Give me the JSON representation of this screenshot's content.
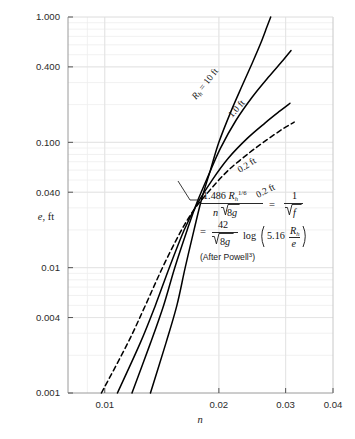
{
  "chart_data": {
    "type": "line",
    "title": "",
    "xlabel": "n",
    "ylabel": "e, ft",
    "xscale": "log",
    "yscale": "log",
    "xlim": [
      0.008,
      0.04
    ],
    "ylim": [
      0.001,
      1.0
    ],
    "grid": true,
    "legend_position": "inline-curve-labels",
    "x_ticks": [
      "0.01",
      "0.02",
      "0.03",
      "0.04"
    ],
    "x_tick_values": [
      0.01,
      0.02,
      0.03,
      0.04
    ],
    "y_ticks": [
      "1.000",
      "0.400",
      "0.100",
      "0.040",
      "0.01",
      "0.004",
      "0.001"
    ],
    "y_tick_values": [
      1.0,
      0.4,
      0.1,
      0.04,
      0.01,
      0.004,
      0.001
    ],
    "series": [
      {
        "name": "R_h = 10 ft",
        "label": "R",
        "label_sub": "h",
        "label_rest": " = 10 ft",
        "style": "solid",
        "points": [
          [
            0.0132,
            0.001
          ],
          [
            0.0145,
            0.0025
          ],
          [
            0.0155,
            0.005
          ],
          [
            0.0163,
            0.01
          ],
          [
            0.0172,
            0.02
          ],
          [
            0.018,
            0.035
          ],
          [
            0.019,
            0.06
          ],
          [
            0.02,
            0.1
          ],
          [
            0.0215,
            0.175
          ],
          [
            0.023,
            0.28
          ],
          [
            0.0245,
            0.43
          ],
          [
            0.0258,
            0.62
          ],
          [
            0.0268,
            0.84
          ],
          [
            0.0274,
            1.0
          ]
        ]
      },
      {
        "name": "1.0 ft",
        "label": "1.0 ft",
        "style": "solid",
        "points": [
          [
            0.0118,
            0.001
          ],
          [
            0.0132,
            0.0025
          ],
          [
            0.0143,
            0.005
          ],
          [
            0.0153,
            0.01
          ],
          [
            0.0165,
            0.02
          ],
          [
            0.0175,
            0.033
          ],
          [
            0.0188,
            0.055
          ],
          [
            0.0202,
            0.09
          ],
          [
            0.0222,
            0.15
          ],
          [
            0.0245,
            0.23
          ],
          [
            0.027,
            0.33
          ],
          [
            0.0295,
            0.45
          ],
          [
            0.031,
            0.54
          ]
        ]
      },
      {
        "name": "0.2 ft",
        "label": "0.2 ft",
        "style": "solid",
        "points": [
          [
            0.0108,
            0.001
          ],
          [
            0.0124,
            0.0025
          ],
          [
            0.0136,
            0.005
          ],
          [
            0.0148,
            0.01
          ],
          [
            0.0162,
            0.02
          ],
          [
            0.0175,
            0.032
          ],
          [
            0.0192,
            0.05
          ],
          [
            0.0212,
            0.075
          ],
          [
            0.0238,
            0.108
          ],
          [
            0.0265,
            0.143
          ],
          [
            0.029,
            0.178
          ],
          [
            0.0308,
            0.205
          ]
        ]
      },
      {
        "name": "0.2 ft (dashed)",
        "label": "0.2 ft",
        "style": "dashed",
        "points": [
          [
            0.0098,
            0.001
          ],
          [
            0.0115,
            0.0025
          ],
          [
            0.0128,
            0.005
          ],
          [
            0.0142,
            0.01
          ],
          [
            0.0158,
            0.019
          ],
          [
            0.0172,
            0.029
          ],
          [
            0.019,
            0.042
          ],
          [
            0.0212,
            0.06
          ],
          [
            0.024,
            0.082
          ],
          [
            0.0268,
            0.105
          ],
          [
            0.0295,
            0.128
          ],
          [
            0.0316,
            0.145
          ]
        ]
      }
    ],
    "annotations": {
      "formula_line1_num": "1.486 R",
      "formula_line1_num_sub": "h",
      "formula_line1_num_sup": "1/6",
      "formula_line1_den": "n",
      "formula_line1_den_rad": "8g",
      "formula_line1_rhs_num": "1",
      "formula_line1_rhs_den_rad": "f",
      "formula_line2_eq": "=",
      "formula_line2_num": "42",
      "formula_line2_den_rad": "8g",
      "formula_line2_log": "log",
      "formula_line2_arg_coef": "5.16",
      "formula_line2_arg_num": "R",
      "formula_line2_arg_num_sub": "h",
      "formula_line2_arg_den": "e",
      "source_note": "(After Powell",
      "source_note_sup": "3",
      "source_note_end": ")"
    },
    "colors": {
      "curve": "#000000",
      "grid": "#ededed",
      "axis": "#8a8a8a",
      "text": "#1a1a1a",
      "background": "#ffffff"
    }
  }
}
